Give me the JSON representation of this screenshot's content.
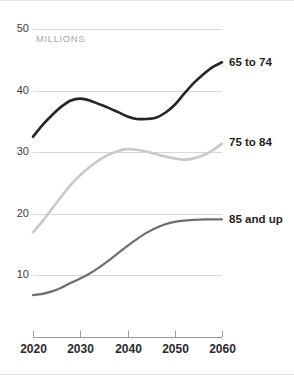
{
  "chart_data": {
    "type": "line",
    "title": "",
    "subtitle": "",
    "unit_label": "MILLIONS",
    "xlabel": "",
    "ylabel": "",
    "xlim": [
      2020,
      2060
    ],
    "ylim": [
      0,
      50
    ],
    "x_ticks": [
      2020,
      2030,
      2040,
      2050,
      2060
    ],
    "y_ticks": [
      10,
      20,
      30,
      40,
      50
    ],
    "grid": "horizontal",
    "legend_position": "right-inline",
    "x": [
      2020,
      2022,
      2024,
      2026,
      2028,
      2030,
      2032,
      2034,
      2036,
      2038,
      2040,
      2042,
      2044,
      2046,
      2048,
      2050,
      2052,
      2054,
      2056,
      2058,
      2060
    ],
    "series": [
      {
        "name": "65 to 74",
        "color": "#262626",
        "width": 2.6,
        "label_y_value": 44.5,
        "values": [
          32.5,
          34.4,
          36.0,
          37.4,
          38.4,
          38.7,
          38.4,
          37.8,
          37.2,
          36.5,
          35.8,
          35.4,
          35.4,
          35.6,
          36.4,
          37.7,
          39.5,
          41.2,
          42.6,
          43.8,
          44.6
        ]
      },
      {
        "name": "75 to 84",
        "color": "#c9c9c9",
        "width": 2.6,
        "label_y_value": 31.5,
        "values": [
          17.0,
          18.8,
          20.8,
          22.8,
          24.7,
          26.3,
          27.6,
          28.7,
          29.6,
          30.2,
          30.5,
          30.4,
          30.1,
          29.7,
          29.3,
          29.0,
          28.8,
          29.0,
          29.5,
          30.3,
          31.4
        ]
      },
      {
        "name": "85 and up",
        "color": "#6e6e6e",
        "width": 2.2,
        "label_y_value": 19.0,
        "values": [
          6.8,
          7.0,
          7.4,
          8.0,
          8.8,
          9.5,
          10.3,
          11.3,
          12.4,
          13.6,
          14.8,
          15.9,
          16.9,
          17.7,
          18.3,
          18.7,
          18.9,
          19.0,
          19.1,
          19.1,
          19.1
        ]
      }
    ]
  },
  "layout": {
    "plot_left": 33,
    "plot_right": 222,
    "plot_top": 28,
    "plot_bottom": 336,
    "y_value_at_top": 50,
    "y_value_at_axis": 0,
    "label_x": 229
  }
}
